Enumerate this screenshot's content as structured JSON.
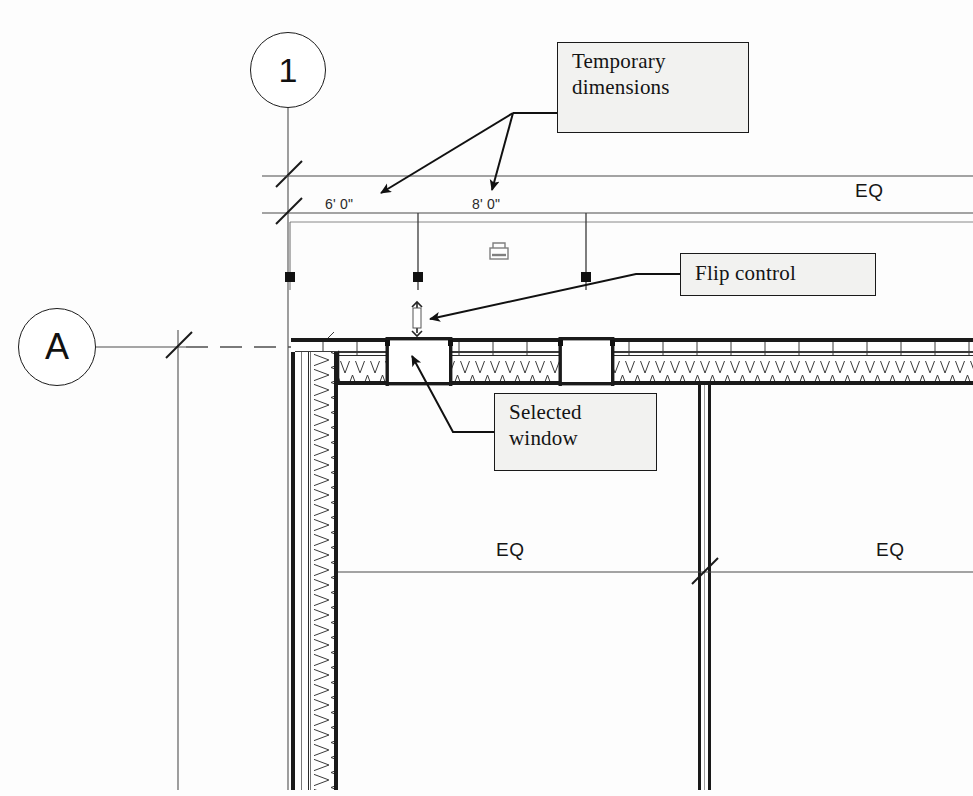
{
  "drawing": {
    "type": "architectural-floor-plan",
    "description": "Revit plan view showing a selected window with temporary dimensions, flip control and EQ constraints"
  },
  "grid_bubbles": [
    {
      "label": "1",
      "axis": "vertical",
      "cx": 288,
      "cy": 70,
      "r": 38
    },
    {
      "label": "A",
      "axis": "horizontal",
      "cx": 57,
      "cy": 347,
      "r": 39
    }
  ],
  "callouts": [
    {
      "id": "temporary-dimensions",
      "lines": [
        "Temporary",
        "dimensions"
      ],
      "x": 557,
      "y": 42,
      "w": 192,
      "h": 91
    },
    {
      "id": "flip-control",
      "lines": [
        "Flip control"
      ],
      "x": 680,
      "y": 253,
      "w": 196,
      "h": 43
    },
    {
      "id": "selected-window",
      "lines": [
        "Selected",
        "window"
      ],
      "x": 494,
      "y": 393,
      "w": 163,
      "h": 78
    }
  ],
  "dimensions": {
    "temporary": [
      {
        "value": "6'  0\"",
        "x": 330,
        "y": 203
      },
      {
        "value": "8'  0\"",
        "x": 477,
        "y": 203
      }
    ],
    "equality_labels": [
      {
        "value": "EQ",
        "x": 860,
        "y": 176,
        "group": "top-overall"
      },
      {
        "value": "EQ",
        "x": 500,
        "y": 546,
        "group": "bottom-left"
      },
      {
        "value": "EQ",
        "x": 880,
        "y": 546,
        "group": "bottom-right"
      }
    ],
    "constraint_icon": {
      "name": "padlock-icon",
      "x": 497,
      "y": 247
    }
  },
  "controls": {
    "flip_control": {
      "name": "flip-control-glyph",
      "x": 416,
      "y": 315
    },
    "drag_handles": [
      {
        "x": 290,
        "y": 277
      },
      {
        "x": 418,
        "y": 277
      },
      {
        "x": 586,
        "y": 277
      }
    ]
  },
  "windows": [
    {
      "id": "window-selected",
      "selected": true,
      "x": 388,
      "y": 338,
      "w": 62,
      "h": 30
    },
    {
      "id": "window-second",
      "selected": false,
      "x": 561,
      "y": 338,
      "w": 52,
      "h": 30
    }
  ],
  "colors": {
    "line": "#1a1a1a",
    "thin_line": "#4a4a4a",
    "callout_fill": "#f2f2f0",
    "paper": "#fdfdfd"
  }
}
